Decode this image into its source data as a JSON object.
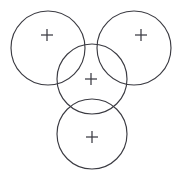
{
  "figure": {
    "background_color": "#ffffff",
    "stroke_color": "#3b3b42",
    "width": 181,
    "height": 191,
    "shape_count": "4",
    "marker_glyph": "+"
  },
  "chart_data": {
    "type": "diagram",
    "xlabel": "",
    "ylabel": "",
    "xlim": [
      0,
      181
    ],
    "ylim": [
      0,
      191
    ],
    "grid": false,
    "legend": "none",
    "shapes": [
      {
        "id": "circle-top-left",
        "label": "Top left circle",
        "cx": 48,
        "cy": 48,
        "r": 37,
        "marker": "+",
        "marker_x": 47,
        "marker_y": 35,
        "stroke": "#3b3b42",
        "fill": "none"
      },
      {
        "id": "circle-top-right",
        "label": "Top right circle",
        "cx": 134,
        "cy": 48,
        "r": 37,
        "marker": "+",
        "marker_x": 141,
        "marker_y": 35,
        "stroke": "#3b3b42",
        "fill": "none"
      },
      {
        "id": "circle-center",
        "label": "Center circle",
        "cx": 92,
        "cy": 79,
        "r": 35,
        "marker": "+",
        "marker_x": 91,
        "marker_y": 79,
        "stroke": "#3b3b42",
        "fill": "none"
      },
      {
        "id": "circle-bottom",
        "label": "Bottom circle",
        "cx": 92,
        "cy": 134,
        "r": 35,
        "marker": "+",
        "marker_x": 92,
        "marker_y": 137,
        "stroke": "#3b3b42",
        "fill": "none"
      }
    ],
    "marker_arm_length": 6
  }
}
